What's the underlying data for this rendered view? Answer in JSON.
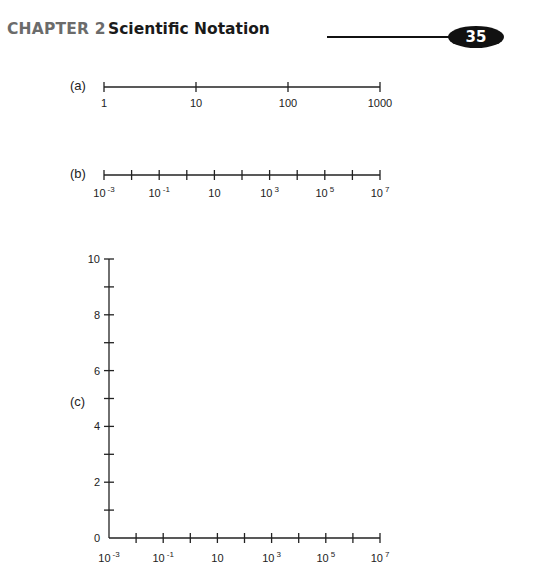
{
  "header": {
    "chapter": "CHAPTER 2",
    "title": "Scientific Notation",
    "page_number": "35"
  },
  "parts": {
    "a": {
      "label": "(a)"
    },
    "b": {
      "label": "(b)"
    },
    "c": {
      "label": "(c)"
    }
  },
  "chart_data": [
    {
      "type": "number-line",
      "id": "a",
      "scale": "log10",
      "ticks": [
        1,
        10,
        100,
        1000
      ],
      "tick_labels": [
        "1",
        "10",
        "100",
        "1000"
      ],
      "range": [
        1,
        1000
      ]
    },
    {
      "type": "number-line",
      "id": "b",
      "scale": "log10",
      "tick_exponents": [
        -3,
        -2,
        -1,
        0,
        1,
        2,
        3,
        4,
        5,
        6,
        7
      ],
      "labels": [
        {
          "exponent": -3,
          "base": "10",
          "sup": "-3"
        },
        {
          "exponent": -1,
          "base": "10",
          "sup": "-1"
        },
        {
          "exponent": 1,
          "base": "10",
          "sup": ""
        },
        {
          "exponent": 3,
          "base": "10",
          "sup": "3"
        },
        {
          "exponent": 5,
          "base": "10",
          "sup": "5"
        },
        {
          "exponent": 7,
          "base": "10",
          "sup": "7"
        }
      ],
      "range_exponent": [
        -3,
        7
      ]
    },
    {
      "type": "scatter",
      "id": "c",
      "title": "",
      "xlabel": "",
      "ylabel": "",
      "xscale": "log10",
      "x_tick_exponents": [
        -3,
        -2,
        -1,
        0,
        1,
        2,
        3,
        4,
        5,
        6,
        7
      ],
      "x_labels": [
        {
          "exponent": -3,
          "base": "10",
          "sup": "-3"
        },
        {
          "exponent": -1,
          "base": "10",
          "sup": "-1"
        },
        {
          "exponent": 1,
          "base": "10",
          "sup": ""
        },
        {
          "exponent": 3,
          "base": "10",
          "sup": "3"
        },
        {
          "exponent": 5,
          "base": "10",
          "sup": "5"
        },
        {
          "exponent": 7,
          "base": "10",
          "sup": "7"
        }
      ],
      "xlim_exponent": [
        -3,
        7
      ],
      "y_ticks": [
        0,
        1,
        2,
        3,
        4,
        5,
        6,
        7,
        8,
        9,
        10
      ],
      "y_labels": [
        "0",
        "2",
        "4",
        "6",
        "8",
        "10"
      ],
      "y_label_values": [
        0,
        2,
        4,
        6,
        8,
        10
      ],
      "ylim": [
        0,
        10
      ],
      "grid": false,
      "points": []
    }
  ]
}
